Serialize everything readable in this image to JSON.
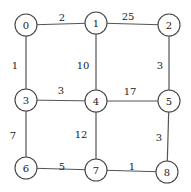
{
  "graph": {
    "node_radius": 11,
    "colors": {
      "edge": "#555555",
      "node_stroke": "#444444",
      "text": "#222222"
    },
    "nodes": [
      {
        "id": "0",
        "label": "0",
        "x": 26,
        "y": 25
      },
      {
        "id": "1",
        "label": "1",
        "x": 96,
        "y": 23
      },
      {
        "id": "2",
        "label": "2",
        "x": 169,
        "y": 25
      },
      {
        "id": "3",
        "label": "3",
        "x": 26,
        "y": 100
      },
      {
        "id": "4",
        "label": "4",
        "x": 96,
        "y": 101
      },
      {
        "id": "5",
        "label": "5",
        "x": 169,
        "y": 101
      },
      {
        "id": "6",
        "label": "6",
        "x": 26,
        "y": 168
      },
      {
        "id": "7",
        "label": "7",
        "x": 96,
        "y": 170
      },
      {
        "id": "8",
        "label": "8",
        "x": 167,
        "y": 172
      }
    ],
    "edges": [
      {
        "from": "0",
        "to": "1",
        "weight": "2",
        "lx": 62,
        "ly": 17
      },
      {
        "from": "1",
        "to": "2",
        "weight": "25",
        "lx": 128,
        "ly": 16
      },
      {
        "from": "0",
        "to": "3",
        "weight": "1",
        "lx": 15,
        "ly": 65
      },
      {
        "from": "1",
        "to": "4",
        "weight": "10",
        "lx": 83,
        "ly": 65
      },
      {
        "from": "2",
        "to": "5",
        "weight": "3",
        "lx": 160,
        "ly": 65
      },
      {
        "from": "3",
        "to": "4",
        "weight": "3",
        "lx": 61,
        "ly": 90
      },
      {
        "from": "4",
        "to": "5",
        "weight": "17",
        "lx": 130,
        "ly": 91
      },
      {
        "from": "3",
        "to": "6",
        "weight": "7",
        "lx": 13,
        "ly": 135
      },
      {
        "from": "4",
        "to": "7",
        "weight": "12",
        "lx": 81,
        "ly": 134
      },
      {
        "from": "5",
        "to": "8",
        "weight": "3",
        "lx": 159,
        "ly": 137
      },
      {
        "from": "6",
        "to": "7",
        "weight": "5",
        "lx": 62,
        "ly": 166
      },
      {
        "from": "7",
        "to": "8",
        "weight": "1",
        "lx": 132,
        "ly": 166
      }
    ]
  }
}
